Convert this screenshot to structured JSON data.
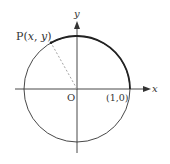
{
  "diagram": {
    "type": "unit-circle",
    "colors": {
      "stroke": "#333333",
      "dashed": "#999999",
      "background": "#ffffff"
    },
    "labels": {
      "point_p_prefix": "P(",
      "point_p_x": "x",
      "point_p_sep": ", ",
      "point_p_y": "y",
      "point_p_suffix": ")",
      "origin": "O",
      "unit_point": "(1,0)",
      "x_axis": "x",
      "y_axis": "y"
    }
  }
}
